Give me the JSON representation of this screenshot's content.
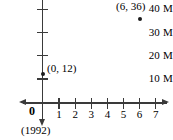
{
  "chart_data": {
    "type": "scatter",
    "title": "",
    "subtitle": "",
    "xlabel": "",
    "ylabel": "",
    "x_origin_note": "(1992)",
    "origin_label": "0",
    "xlim": [
      0,
      7.6
    ],
    "ylim": [
      0,
      42
    ],
    "grid": false,
    "legend": null,
    "x_ticks": [
      {
        "value": 1,
        "label": "1"
      },
      {
        "value": 2,
        "label": "2"
      },
      {
        "value": 3,
        "label": "3"
      },
      {
        "value": 4,
        "label": "4"
      },
      {
        "value": 5,
        "label": "5"
      },
      {
        "value": 6,
        "label": "6"
      },
      {
        "value": 7,
        "label": "7"
      }
    ],
    "y_ticks": [
      {
        "value": 10,
        "label": "10 M"
      },
      {
        "value": 20,
        "label": "20 M"
      },
      {
        "value": 30,
        "label": "30 M"
      },
      {
        "value": 40,
        "label": "40 M"
      }
    ],
    "points": [
      {
        "x": 0,
        "y": 12,
        "label": "(0, 12)"
      },
      {
        "x": 6,
        "y": 36,
        "label": "(6, 36)"
      }
    ],
    "series": [
      {
        "name": "data",
        "x": [
          0,
          6
        ],
        "y": [
          12,
          36
        ]
      }
    ],
    "marker_color": "#1a1a1a",
    "axis_color": "#3a3a3a"
  }
}
